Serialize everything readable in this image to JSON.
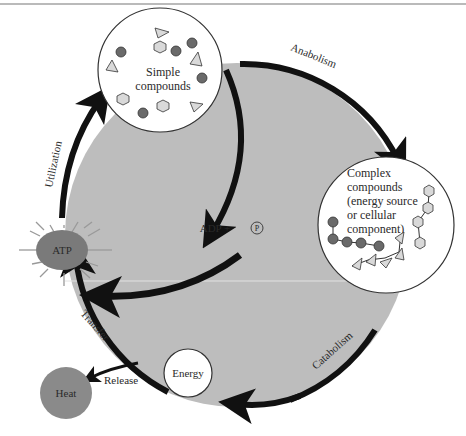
{
  "nodes": {
    "simple": {
      "line1": "Simple",
      "line2": "compounds"
    },
    "complex": {
      "lines": [
        "Complex",
        "compounds",
        "(energy source",
        "or cellular",
        "component)"
      ]
    },
    "atp": {
      "label": "ATP"
    },
    "adp": {
      "label": "ADP +",
      "phosphate": "P"
    },
    "energy": {
      "label": "Energy"
    },
    "heat": {
      "label": "Heat"
    }
  },
  "process_labels": {
    "anabolism": "Anabolism",
    "catabolism": "Catabolism",
    "utilization": "Utilization",
    "transfer": "Transfer",
    "release": "Release"
  },
  "colors": {
    "cycle_fill": "#bdbdbd",
    "arrow": "#111111",
    "atp_fill": "#7a7a7a",
    "heat_fill": "#8a8a8a",
    "molecule_dark": "#6a6a6a",
    "molecule_light": "#d9d9d9"
  }
}
